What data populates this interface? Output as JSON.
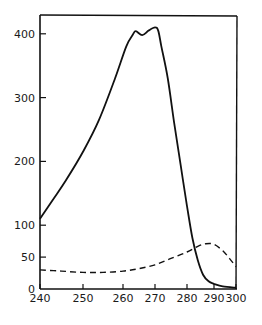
{
  "chart_data": {
    "type": "line",
    "title": "",
    "xlabel": "",
    "ylabel": "",
    "xlim": [
      240,
      300
    ],
    "ylim": [
      0,
      430
    ],
    "grid": false,
    "legend": null,
    "x_ticks": [
      240,
      250,
      260,
      270,
      280,
      290,
      300
    ],
    "y_ticks": [
      0,
      50,
      100,
      200,
      300,
      400
    ],
    "series": [
      {
        "name": "solid",
        "style": "solid",
        "x": [
          240,
          243,
          246,
          250,
          254,
          258,
          261,
          263,
          264,
          266,
          268,
          270,
          271,
          272,
          274,
          276,
          278,
          280,
          282,
          284,
          286,
          288,
          290,
          294,
          300
        ],
        "y": [
          110,
          140,
          170,
          215,
          265,
          330,
          380,
          398,
          404,
          398,
          405,
          410,
          405,
          380,
          330,
          260,
          195,
          130,
          80,
          45,
          22,
          12,
          8,
          4,
          2
        ]
      },
      {
        "name": "dashed",
        "style": "dashed",
        "x": [
          240,
          245,
          250,
          255,
          260,
          265,
          270,
          275,
          280,
          284,
          287,
          290,
          294,
          297,
          300
        ],
        "y": [
          30,
          28,
          26,
          26,
          28,
          32,
          38,
          48,
          58,
          67,
          71,
          70,
          60,
          48,
          35
        ]
      }
    ]
  }
}
